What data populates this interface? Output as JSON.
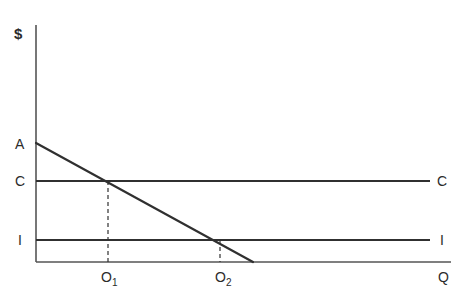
{
  "chart_data": {
    "type": "line",
    "title": "",
    "subtitle": "",
    "xlabel": "Q",
    "ylabel": "$",
    "grid": false,
    "legend": "none",
    "axes": {
      "x_axis_label": "Q",
      "y_axis_label": "$",
      "x_axis_name": "Quantity",
      "y_axis_name": "Dollars",
      "xlim": [
        0,
        100
      ],
      "ylim": [
        0,
        100
      ],
      "x_origin_px": 36,
      "y_origin_px": 262,
      "x_end_px": 451,
      "y_top_px": 25
    },
    "series": [
      {
        "name": "A",
        "label": "A",
        "role": "demand-curve",
        "type": "line",
        "style": "solid",
        "color": "#303030",
        "width": 2.2,
        "points": [
          {
            "x_px": 36,
            "y_px": 143
          },
          {
            "x_px": 253,
            "y_px": 262
          }
        ],
        "label_position": "left-axis-intercept"
      },
      {
        "name": "C",
        "label": "C",
        "role": "average-cost-line",
        "type": "horizontal-line",
        "style": "solid",
        "color": "#303030",
        "width": 1.8,
        "y_px": 181,
        "x_start_px": 36,
        "x_end_px": 430,
        "left_label": "C",
        "right_label": "C"
      },
      {
        "name": "I",
        "label": "I",
        "role": "marginal-cost-line",
        "type": "horizontal-line",
        "style": "solid",
        "color": "#303030",
        "width": 1.8,
        "y_px": 240,
        "x_start_px": 36,
        "x_end_px": 430,
        "left_label": "I",
        "right_label": "I"
      }
    ],
    "guides": [
      {
        "name": "O1-guide",
        "type": "vertical-dashed",
        "x_px": 108,
        "y_start_px": 181,
        "y_end_px": 262,
        "color": "#303030",
        "dash": "4 3",
        "tick_label": "O1",
        "tick_label_display": "O",
        "tick_label_sub": "1"
      },
      {
        "name": "O2-guide",
        "type": "vertical-dashed",
        "x_px": 220,
        "y_start_px": 240,
        "y_end_px": 262,
        "color": "#303030",
        "dash": "4 3",
        "tick_label": "O2",
        "tick_label_display": "O",
        "tick_label_sub": "2"
      }
    ],
    "intersections": [
      {
        "name": "A-x-C",
        "x_px": 108,
        "y_px": 181,
        "x_tick": "O1",
        "y_tick": "C"
      },
      {
        "name": "A-x-I",
        "x_px": 220,
        "y_px": 240,
        "x_tick": "O2",
        "y_tick": "I"
      }
    ],
    "x_tick_labels": [
      "O1",
      "O2"
    ],
    "y_tick_labels": [
      "A",
      "C",
      "I"
    ]
  },
  "labels": {
    "y_axis": "$",
    "x_axis": "Q",
    "a_left": "A",
    "c_left": "C",
    "i_left": "I",
    "c_right": "C",
    "i_right": "I",
    "o1_base": "O",
    "o1_sub": "1",
    "o2_base": "O",
    "o2_sub": "2"
  },
  "colors": {
    "background": "#ffffff",
    "line": "#303030",
    "axis": "#555555",
    "text": "#2b2b2b"
  }
}
